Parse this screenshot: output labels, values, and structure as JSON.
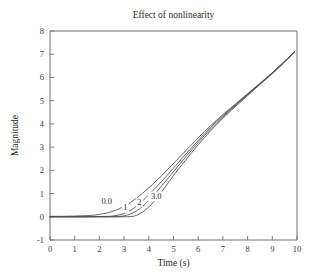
{
  "chart_data": {
    "type": "line",
    "title": "Effect of nonlinearity",
    "xlabel": "Time (s)",
    "ylabel": "Magnitude",
    "xlim": [
      0,
      10
    ],
    "ylim": [
      -1,
      8
    ],
    "xticks": [
      0,
      1,
      2,
      3,
      4,
      5,
      6,
      7,
      8,
      9,
      10
    ],
    "xtick_labels": [
      "0",
      "1",
      "2",
      "3",
      "4",
      "5",
      "6",
      "7",
      "8",
      "9",
      "10"
    ],
    "yticks": [
      -1,
      0,
      1,
      2,
      3,
      4,
      5,
      6,
      7,
      8
    ],
    "ytick_labels": [
      "-1",
      "0",
      "1",
      "2",
      "3",
      "4",
      "5",
      "6",
      "7",
      "8"
    ],
    "grid": false,
    "legend": "inline-annotations",
    "line_color": "#4a4a4a",
    "x": [
      0,
      0.5,
      1,
      1.5,
      2,
      2.5,
      3,
      3.5,
      4,
      4.5,
      5,
      5.5,
      6,
      6.5,
      7,
      7.5,
      8,
      8.5,
      9,
      9.5,
      9.9
    ],
    "series": [
      {
        "name": "0.0",
        "label": "0.0",
        "label_x": 2.3,
        "label_y": 0.55,
        "values": [
          0.02,
          0.02,
          0.03,
          0.05,
          0.1,
          0.22,
          0.45,
          0.8,
          1.25,
          1.75,
          2.3,
          2.85,
          3.4,
          3.92,
          4.4,
          4.85,
          5.3,
          5.75,
          6.2,
          6.7,
          7.1
        ]
      },
      {
        "name": "1",
        "label": "1",
        "label_x": 3.05,
        "label_y": 0.28,
        "values": [
          0.0,
          0.0,
          0.0,
          0.0,
          0.01,
          0.03,
          0.14,
          0.45,
          0.95,
          1.5,
          2.1,
          2.7,
          3.28,
          3.85,
          4.35,
          4.82,
          5.28,
          5.73,
          6.2,
          6.7,
          7.1
        ]
      },
      {
        "name": "2",
        "label": "2",
        "label_x": 3.62,
        "label_y": 0.52,
        "values": [
          0.0,
          0.0,
          0.0,
          0.0,
          0.0,
          0.0,
          0.04,
          0.25,
          0.7,
          1.3,
          1.95,
          2.58,
          3.2,
          3.78,
          4.3,
          4.78,
          5.25,
          5.72,
          6.18,
          6.68,
          7.1
        ]
      },
      {
        "name": "3.0",
        "label": "3.0",
        "label_x": 4.3,
        "label_y": 0.78,
        "values": [
          0.0,
          0.0,
          0.0,
          0.0,
          0.0,
          0.0,
          0.0,
          0.06,
          0.42,
          1.05,
          1.78,
          2.45,
          3.1,
          3.7,
          4.24,
          4.74,
          5.22,
          5.7,
          6.16,
          6.66,
          7.1
        ]
      }
    ]
  },
  "geometry": {
    "plot_left": 50,
    "plot_right": 297,
    "plot_top": 31,
    "plot_bottom": 240
  }
}
